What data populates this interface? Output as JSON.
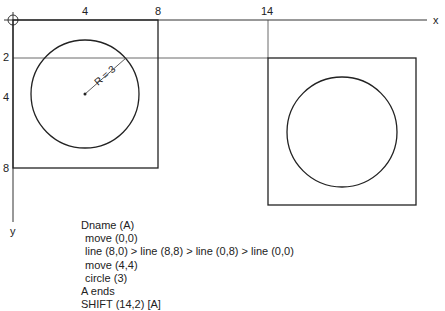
{
  "axes": {
    "x_label": "x",
    "y_label": "y",
    "x_ticks": [
      "4",
      "8",
      "14"
    ],
    "y_ticks": [
      "2",
      "4",
      "8"
    ]
  },
  "annotation": {
    "radius_label": "R = 3"
  },
  "colors": {
    "stroke": "#222222",
    "background": "#ffffff"
  },
  "program": {
    "lines": [
      {
        "text": "Dname (A)",
        "indent": false
      },
      {
        "text": "move (0,0)",
        "indent": true
      },
      {
        "text": "line (8,0) > line (8,8) > line (0,8) > line (0,0)",
        "indent": true
      },
      {
        "text": "move (4,4)",
        "indent": true
      },
      {
        "text": "circle (3)",
        "indent": true
      },
      {
        "text": "A ends",
        "indent": false
      },
      {
        "text": "SHIFT (14,2) [A]",
        "indent": false
      }
    ]
  }
}
